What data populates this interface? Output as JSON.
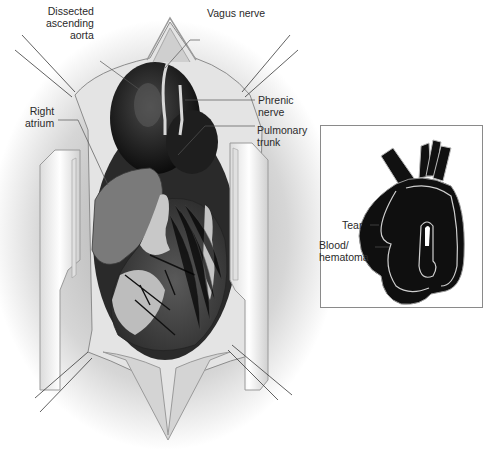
{
  "figure": {
    "colors": {
      "background": "#ffffff",
      "tissue_dark": "#1a1a1a",
      "tissue_mid": "#6e6e6e",
      "tissue_light": "#c8c8c8",
      "retractor": "#f2f2f2",
      "label_text": "#2a2a2a",
      "leader_line": "#555555",
      "inset_border": "#8a8a8a"
    }
  },
  "main_labels": {
    "dissected_aorta": "Dissected\nascending\naorta",
    "vagus_nerve": "Vagus nerve",
    "phrenic_nerve": "Phrenic\nnerve",
    "pulmonary_trunk": "Pulmonary\ntrunk",
    "right_atrium": "Right\natrium"
  },
  "inset": {
    "labels": {
      "tear": "Tear",
      "hematoma": "Blood/\nhematoma"
    }
  }
}
